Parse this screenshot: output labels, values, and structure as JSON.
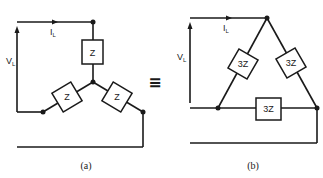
{
  "figure": {
    "equivalence_symbol": "≡",
    "panel_a": {
      "caption": "(a)",
      "type": "star (wye) connection",
      "current_label": "I",
      "current_sub": "L",
      "voltage_label": "V",
      "voltage_sub": "L",
      "impedances": [
        "Z",
        "Z",
        "Z"
      ]
    },
    "panel_b": {
      "caption": "(b)",
      "type": "delta connection",
      "current_label": "I",
      "current_sub": "L",
      "voltage_label": "V",
      "voltage_sub": "L",
      "impedances": [
        "3Z",
        "3Z",
        "3Z"
      ]
    }
  },
  "colors": {
    "line": "#1a1a1a",
    "background": "#ffffff"
  }
}
